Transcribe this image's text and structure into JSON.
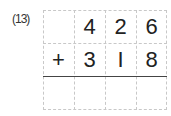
{
  "problem": {
    "label": "(13)",
    "rows": [
      [
        "",
        "4",
        "2",
        "6"
      ],
      [
        "+",
        "3",
        "I",
        "8"
      ],
      [
        "",
        "",
        "",
        ""
      ]
    ]
  }
}
